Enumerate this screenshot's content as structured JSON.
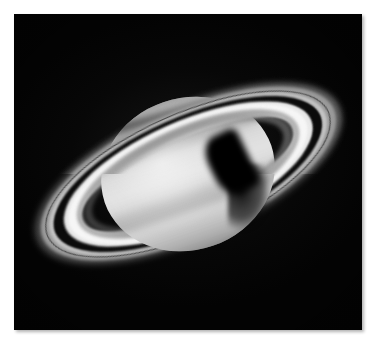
{
  "image": {
    "subject": "Saturn",
    "kind": "telescope-photograph",
    "palette": "grayscale",
    "caption": "",
    "alt_text": "Grayscale telescope photograph of the planet Saturn and its ring system against a black sky",
    "canvas": {
      "width": 377,
      "height": 351,
      "background_color": "#ffffff"
    },
    "plate": {
      "left": 14,
      "top": 14,
      "width": 348,
      "height": 316,
      "background_color": "#000000",
      "has_drop_shadow": true
    },
    "colors": {
      "sky": "#030303",
      "planet_base": "#d9d9d9",
      "ring_b_bright": "#f6f6f6",
      "ring_a": "#9a9a9a",
      "cassini_division": "#0b0b0b",
      "ring_c": "#696969",
      "shadow": "#000000"
    },
    "geometry": {
      "ring_tilt_degrees": -24,
      "planet_tilt_degrees": -19,
      "planet_center_x": 174,
      "planet_center_y": 160,
      "planet_width": 176,
      "planet_height": 152
    },
    "features": [
      {
        "id": "planet-disk",
        "label": "Planet disk",
        "note": "oblate ellipsoid, bright equatorial zone"
      },
      {
        "id": "cloud-bands",
        "label": "Cloud belts and zones",
        "note": "alternating light zones and dark belts"
      },
      {
        "id": "polar-region",
        "label": "Darkened polar region",
        "note": "upper-left limb darkening"
      },
      {
        "id": "ring-a",
        "label": "A ring",
        "note": "outer, dimmer ring"
      },
      {
        "id": "ring-encke",
        "label": "Encke gap",
        "note": "thin dark line within the A ring"
      },
      {
        "id": "cassini-division",
        "label": "Cassini Division",
        "note": "dark gap between A and B rings"
      },
      {
        "id": "ring-b",
        "label": "B ring",
        "note": "brightest, broadest ring"
      },
      {
        "id": "ring-c",
        "label": "C ring",
        "note": "faint innermost crepe ring"
      },
      {
        "id": "ring-shadow-on-planet",
        "label": "Ring shadow on planet",
        "note": "dark band across northern limb"
      },
      {
        "id": "planet-shadow-on-rings",
        "label": "Planet shadow on rings",
        "note": "black wedge cast onto the eastern ansa"
      }
    ]
  }
}
